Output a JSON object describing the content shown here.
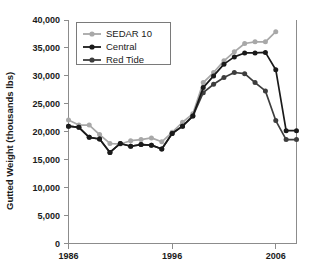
{
  "chart_data": {
    "type": "line",
    "title": "",
    "xlabel": "",
    "ylabel": "Gutted Weight (thousands lbs)",
    "xlim": [
      1986,
      2008
    ],
    "ylim": [
      0,
      40000
    ],
    "grid": false,
    "legend_position": "top-left",
    "x_ticks": [
      1986,
      1996,
      2006
    ],
    "x_tick_labels": [
      "1986",
      "1996",
      "2006"
    ],
    "y_ticks": [
      0,
      5000,
      10000,
      15000,
      20000,
      25000,
      30000,
      35000,
      40000
    ],
    "y_tick_labels": [
      "0",
      "5,000",
      "10,000",
      "15,000",
      "20,000",
      "25,000",
      "30,000",
      "35,000",
      "40,000"
    ],
    "x": [
      1986,
      1987,
      1988,
      1989,
      1990,
      1991,
      1992,
      1993,
      1994,
      1995,
      1996,
      1997,
      1998,
      1999,
      2000,
      2001,
      2002,
      2003,
      2004,
      2005,
      2006,
      2007,
      2008
    ],
    "series": [
      {
        "name": "SEDAR 10",
        "color": "#a8a8a8",
        "marker": "circle",
        "values": [
          22100,
          21200,
          21200,
          19500,
          17900,
          17800,
          18400,
          18600,
          18900,
          18200,
          19900,
          21700,
          23200,
          28800,
          30600,
          32700,
          34300,
          35800,
          36100,
          36100,
          37900,
          null,
          null
        ]
      },
      {
        "name": "Central",
        "color": "#1a1a1a",
        "marker": "circle",
        "values": [
          21000,
          20800,
          19000,
          18700,
          16300,
          17900,
          17400,
          17700,
          17600,
          16900,
          19700,
          21000,
          22800,
          27900,
          30000,
          32100,
          33400,
          34100,
          34100,
          34200,
          31100,
          20200,
          20200
        ]
      },
      {
        "name": "Red Tide",
        "color": "#3d3d3d",
        "marker": "circle",
        "values": [
          21000,
          20800,
          19000,
          18700,
          16300,
          17900,
          17400,
          17700,
          17600,
          16900,
          19700,
          21000,
          22800,
          27000,
          28500,
          29700,
          30600,
          30400,
          28800,
          27300,
          22000,
          18600,
          18600
        ]
      }
    ],
    "extra_points": {
      "note": "tail segments",
      "central_tail": [
        [
          2007,
          20200
        ],
        [
          2008,
          18600
        ]
      ],
      "red_tide_tail": [
        [
          2007,
          18600
        ],
        [
          2008,
          16800
        ]
      ]
    }
  },
  "legend": {
    "entries": [
      {
        "label": "SEDAR 10"
      },
      {
        "label": "Central"
      },
      {
        "label": "Red Tide"
      }
    ]
  }
}
